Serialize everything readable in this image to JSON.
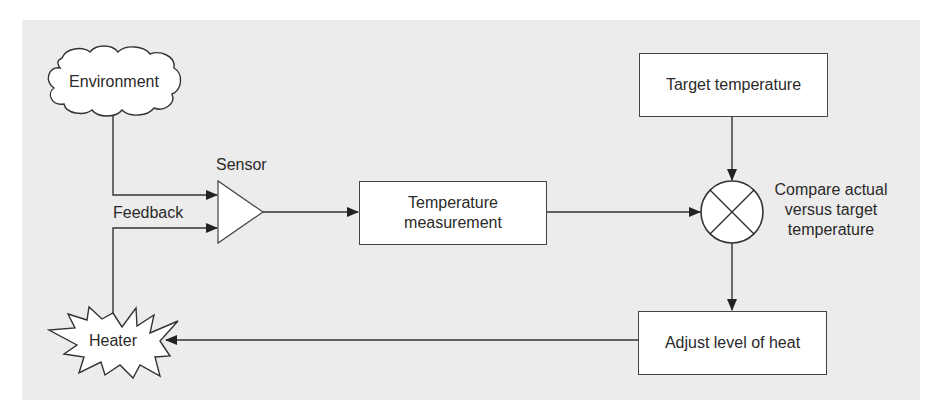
{
  "diagram": {
    "title": "",
    "nodes": {
      "environment": {
        "label": "Environment",
        "shape": "cloud"
      },
      "sensor": {
        "label": "Sensor",
        "shape": "triangle"
      },
      "feedback": {
        "label": "Feedback"
      },
      "temperature_measurement": {
        "label": "Temperature\nmeasurement",
        "shape": "rectangle"
      },
      "target_temperature": {
        "label": "Target temperature",
        "shape": "rectangle"
      },
      "compare": {
        "label": "Compare actual\nversus target\ntemperature",
        "shape": "circle-cross"
      },
      "adjust_heat": {
        "label": "Adjust level of heat",
        "shape": "rectangle"
      },
      "heater": {
        "label": "Heater",
        "shape": "starburst"
      }
    },
    "edges": [
      {
        "from": "Environment",
        "to": "Sensor"
      },
      {
        "from": "Heater",
        "to": "Sensor",
        "label": "Feedback"
      },
      {
        "from": "Sensor",
        "to": "Temperature measurement"
      },
      {
        "from": "Temperature measurement",
        "to": "Compare actual versus target temperature"
      },
      {
        "from": "Target temperature",
        "to": "Compare actual versus target temperature"
      },
      {
        "from": "Compare actual versus target temperature",
        "to": "Adjust level of heat"
      },
      {
        "from": "Adjust level of heat",
        "to": "Heater"
      }
    ],
    "colors": {
      "panel": "#ececec",
      "node_fill": "#ffffff",
      "stroke": "#333333"
    }
  }
}
